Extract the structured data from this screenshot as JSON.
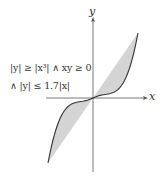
{
  "figure": {
    "axes": {
      "x_label": "x",
      "y_label": "y"
    },
    "condition": {
      "line1": "|y| ≥ |x³| ∧ xy ≥ 0",
      "line2": "∧ |y| ≤ 1.7|x|"
    },
    "colors": {
      "shade": "#d4d4d4",
      "curve": "#333333",
      "axis": "#555555"
    }
  }
}
